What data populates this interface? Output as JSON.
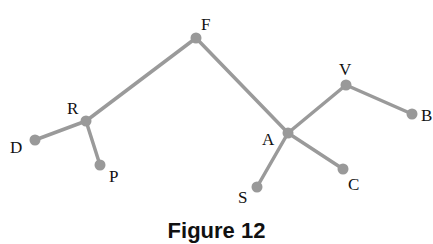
{
  "diagram": {
    "type": "tree",
    "nodes": [
      {
        "id": "F",
        "label": "F",
        "x": 196,
        "y": 38,
        "lx": 201,
        "ly": 30
      },
      {
        "id": "R",
        "label": "R",
        "x": 86,
        "y": 121,
        "lx": 67,
        "ly": 114
      },
      {
        "id": "D",
        "label": "D",
        "x": 35,
        "y": 140,
        "lx": 10,
        "ly": 153
      },
      {
        "id": "P",
        "label": "P",
        "x": 100,
        "y": 165,
        "lx": 109,
        "ly": 182
      },
      {
        "id": "A",
        "label": "A",
        "x": 288,
        "y": 133,
        "lx": 262,
        "ly": 145
      },
      {
        "id": "V",
        "label": "V",
        "x": 346,
        "y": 85,
        "lx": 339,
        "ly": 75
      },
      {
        "id": "B",
        "label": "B",
        "x": 412,
        "y": 114,
        "lx": 421,
        "ly": 121
      },
      {
        "id": "C",
        "label": "C",
        "x": 343,
        "y": 169,
        "lx": 348,
        "ly": 190
      },
      {
        "id": "S",
        "label": "S",
        "x": 257,
        "y": 187,
        "lx": 238,
        "ly": 203
      }
    ],
    "edges": [
      [
        "F",
        "R"
      ],
      [
        "R",
        "D"
      ],
      [
        "R",
        "P"
      ],
      [
        "F",
        "A"
      ],
      [
        "A",
        "V"
      ],
      [
        "V",
        "B"
      ],
      [
        "A",
        "C"
      ],
      [
        "A",
        "S"
      ]
    ]
  },
  "caption": "Figure 12"
}
